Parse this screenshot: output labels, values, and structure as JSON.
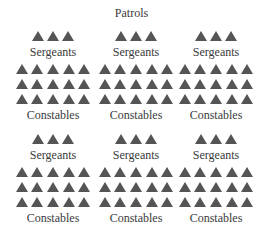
{
  "title": "Patrols",
  "colors": {
    "triangle": "#555555",
    "text": "#3a3a3a"
  },
  "icon": "triangle-icon",
  "patrols": [
    {
      "sergeants_label": "Sergeants",
      "sergeants": 3,
      "constables_label": "Constables",
      "constable_rows": 3,
      "constables_per_row": 5
    },
    {
      "sergeants_label": "Sergeants",
      "sergeants": 3,
      "constables_label": "Constables",
      "constable_rows": 3,
      "constables_per_row": 5
    },
    {
      "sergeants_label": "Sergeants",
      "sergeants": 3,
      "constables_label": "Constables",
      "constable_rows": 3,
      "constables_per_row": 5
    },
    {
      "sergeants_label": "Sergeants",
      "sergeants": 3,
      "constables_label": "Constables",
      "constable_rows": 3,
      "constables_per_row": 5
    },
    {
      "sergeants_label": "Sergeants",
      "sergeants": 3,
      "constables_label": "Constables",
      "constable_rows": 3,
      "constables_per_row": 5
    },
    {
      "sergeants_label": "Sergeants",
      "sergeants": 3,
      "constables_label": "Constables",
      "constable_rows": 3,
      "constables_per_row": 5
    }
  ]
}
